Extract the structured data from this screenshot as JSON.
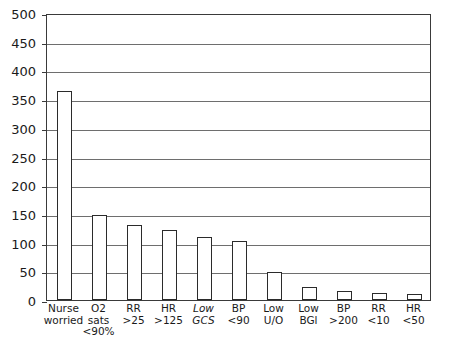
{
  "chart_data": {
    "type": "bar",
    "title": "",
    "subtitle": "",
    "xlabel": "",
    "ylabel": "",
    "ylim": [
      0,
      500
    ],
    "ytick_step": 50,
    "yticks": [
      "500",
      "450",
      "400",
      "350",
      "300",
      "250",
      "200",
      "150",
      "100",
      "50",
      "0"
    ],
    "grid": true,
    "legend": "none",
    "categories": [
      "Nurse worried",
      "O2 sats <90%",
      "RR >25",
      "HR >125",
      "Low GCS",
      "BP <90",
      "Low U/O",
      "Low BGl",
      "BP >200",
      "RR <10",
      "HR <50"
    ],
    "category_lines": [
      {
        "line1": "Nurse",
        "line2": "worried",
        "italic": false
      },
      {
        "line1": "O2",
        "line2": "sats",
        "line3": "<90%",
        "italic": false
      },
      {
        "line1": "RR",
        "line2": ">25",
        "italic": false
      },
      {
        "line1": "HR",
        "line2": ">125",
        "italic": false
      },
      {
        "line1": "Low",
        "line2": "GCS",
        "italic": true
      },
      {
        "line1": "BP",
        "line2": "<90",
        "italic": false
      },
      {
        "line1": "Low",
        "line2": "U/O",
        "italic": false
      },
      {
        "line1": "Low",
        "line2": "BGl",
        "italic": false
      },
      {
        "line1": "BP",
        "line2": ">200",
        "italic": false
      },
      {
        "line1": "RR",
        "line2": "<10",
        "italic": false
      },
      {
        "line1": "HR",
        "line2": "<50",
        "italic": false
      }
    ],
    "values": [
      365,
      148,
      130,
      122,
      110,
      102,
      48,
      22,
      15,
      13,
      10
    ]
  },
  "style": {
    "bar_fill": "#ffffff",
    "bar_edge": "#2b2b2b",
    "grid_color": "#6e6e6e",
    "axis_color": "#3a3a3a",
    "text_color": "#1a1a1a",
    "background": "#ffffff"
  }
}
